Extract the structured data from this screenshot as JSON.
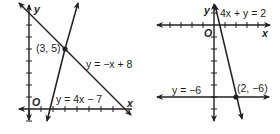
{
  "graphs": [
    {
      "id": "left",
      "axis_labels": {
        "x": "x",
        "y": "y",
        "origin": "O"
      },
      "x_range": [
        -1,
        8.5
      ],
      "y_range": [
        -1,
        8.5
      ],
      "lines": [
        {
          "equation": "y = −x + 8",
          "slope": -1,
          "intercept": 8
        },
        {
          "equation": "y = 4x − 7",
          "slope": 4,
          "intercept": -7
        }
      ],
      "intersection": {
        "label": "(3, 5)",
        "x": 3,
        "y": 5
      }
    },
    {
      "id": "right",
      "axis_labels": {
        "x": "x",
        "y": "y",
        "origin": "O"
      },
      "x_range": [
        -5,
        5
      ],
      "y_range": [
        -8,
        2
      ],
      "lines": [
        {
          "equation": "4x + y = 2",
          "slope": -4,
          "intercept": 2
        },
        {
          "equation": "y = −6",
          "slope": 0,
          "intercept": -6
        }
      ],
      "intersection": {
        "label": "(2, −6)",
        "x": 2,
        "y": -6
      }
    }
  ]
}
